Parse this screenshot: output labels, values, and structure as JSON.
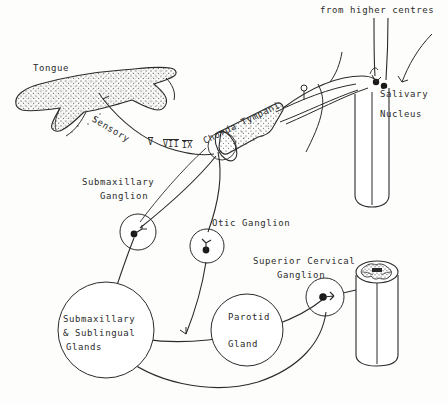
{
  "figure": {
    "width": 448,
    "height": 403,
    "background_color": "#fdfdfb",
    "ink_color": "#2b2b2b"
  },
  "labels": {
    "tongue": "Tongue",
    "sensory": "Sensory",
    "cranial_nerves": [
      "V",
      "VII",
      "IX"
    ],
    "chorda_tympani": "Chorda Tympani",
    "from_higher_centres": "from higher centres",
    "salivary_nucleus_line1": "Salivary",
    "salivary_nucleus_line2": "Nucleus",
    "submaxillary_ganglion_line1": "Submaxillary",
    "submaxillary_ganglion_line2": "Ganglion",
    "otic_ganglion": "Otic Ganglion",
    "superior_cervical_ganglion_line1": "Superior Cervical",
    "superior_cervical_ganglion_line2": "Ganglion",
    "submaxillary_sublingual_line1": "Submaxillary",
    "submaxillary_sublingual_line2": "& Sublingual",
    "submaxillary_sublingual_line3": "Glands",
    "parotid_line1": "Parotid",
    "parotid_line2": "Gland"
  },
  "structures": {
    "tongue": "stippled-tongue-outline",
    "brainstem": "brainstem-cylinder",
    "spinal_cord": "spinal-cord-cylinder-with-grey-matter",
    "nerve_trunk": "stippled-nerve-trunk-cylinder",
    "ganglion_marker": "circle-with-synapse-dot"
  }
}
